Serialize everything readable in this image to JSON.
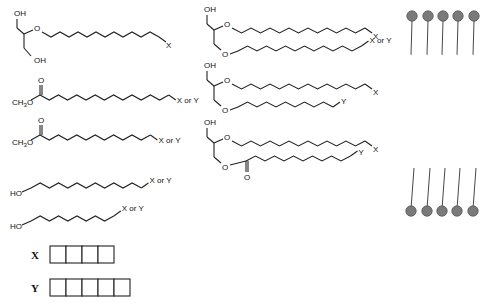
{
  "molecules": [
    {
      "id": "m1",
      "head": "glycerol-2-ether",
      "labels": {
        "top_oh": "OH",
        "bottom_oh": "OH",
        "o": "O"
      },
      "chain_carbons": 10,
      "terminal": "X"
    },
    {
      "id": "m2",
      "head": "methyl-ester",
      "labels": {
        "methyl": "CH3O",
        "carbonyl_o": "O"
      },
      "chain_carbons": 10,
      "terminal": "X or Y"
    },
    {
      "id": "m3",
      "head": "methyl-ester",
      "labels": {
        "methyl": "CH3O",
        "carbonyl_o": "O"
      },
      "chain_carbons": 9,
      "terminal": "X or Y"
    },
    {
      "id": "m4",
      "head": "alcohol",
      "labels": {
        "oh": "HO"
      },
      "chain_carbons": 10,
      "terminal": "X or Y"
    },
    {
      "id": "m5",
      "head": "alcohol",
      "labels": {
        "oh": "HO"
      },
      "chain_carbons": 8,
      "terminal": "X or Y"
    },
    {
      "id": "m6",
      "head": "glycerol-diether",
      "labels": {
        "oh": "OH",
        "o1": "O",
        "o2": "O"
      },
      "chains": [
        {
          "carbons": 10,
          "terminal": "X"
        },
        {
          "carbons": 10,
          "terminal": "X or Y"
        }
      ]
    },
    {
      "id": "m7",
      "head": "glycerol-diether",
      "labels": {
        "oh": "OH",
        "o1": "O",
        "o2": "O"
      },
      "chains": [
        {
          "carbons": 10,
          "terminal": "X"
        },
        {
          "carbons": 8,
          "terminal": "Y"
        }
      ]
    },
    {
      "id": "m8",
      "head": "glycerol-ether-ester",
      "labels": {
        "oh": "OH",
        "o1": "O",
        "o2": "O",
        "carbonyl_o": "O"
      },
      "chains": [
        {
          "carbons": 10,
          "terminal": "X"
        },
        {
          "carbons": 9,
          "terminal": "Y"
        }
      ]
    }
  ],
  "legend": [
    {
      "symbol": "X",
      "units": 4
    },
    {
      "symbol": "Y",
      "units": 5
    }
  ],
  "bilayer": {
    "lipids_per_leaflet": 5,
    "leaflets": 2,
    "head_color": "#7a7a7a"
  }
}
